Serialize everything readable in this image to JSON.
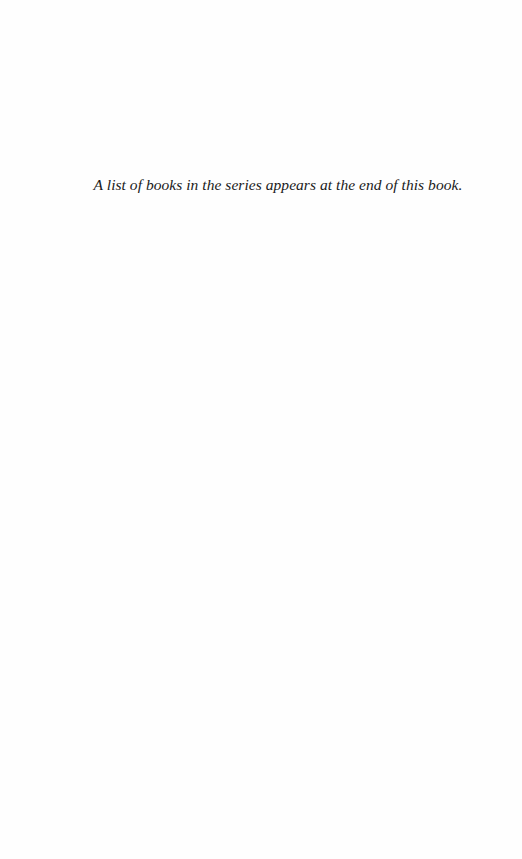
{
  "page": {
    "note": "A list of books in the series appears at the end of this book."
  }
}
